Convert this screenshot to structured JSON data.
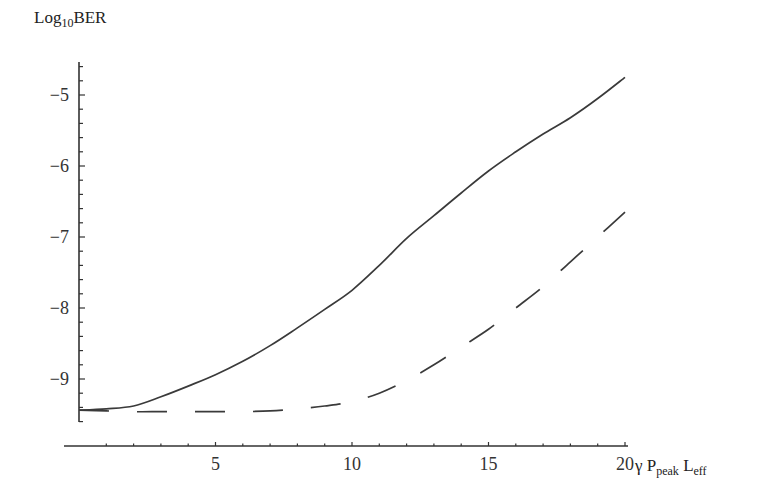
{
  "chart_data": {
    "type": "line",
    "title": "",
    "xlabel": "γ P_peak L_eff",
    "ylabel": "Log10BER",
    "xlim": [
      0,
      20
    ],
    "ylim": [
      -9.6,
      -4.5
    ],
    "x_ticks": [
      5,
      10,
      15,
      20
    ],
    "y_ticks": [
      -5,
      -6,
      -7,
      -8,
      -9
    ],
    "grid": false,
    "legend": null,
    "series": [
      {
        "name": "solid",
        "style": "solid",
        "x": [
          0,
          1,
          2,
          3,
          4,
          5,
          6,
          7,
          8,
          9,
          10,
          11,
          12,
          13,
          14,
          15,
          16,
          17,
          18,
          19,
          20
        ],
        "values": [
          -9.44,
          -9.42,
          -9.38,
          -9.25,
          -9.1,
          -8.94,
          -8.75,
          -8.53,
          -8.28,
          -8.02,
          -7.75,
          -7.4,
          -7.02,
          -6.7,
          -6.38,
          -6.07,
          -5.8,
          -5.55,
          -5.32,
          -5.05,
          -4.75
        ]
      },
      {
        "name": "dashed",
        "style": "dashed",
        "x": [
          0,
          1,
          2,
          3,
          4,
          5,
          6,
          7,
          8,
          9,
          10,
          11,
          12,
          13,
          14,
          15,
          16,
          17,
          18,
          19,
          20
        ],
        "values": [
          -9.44,
          -9.45,
          -9.46,
          -9.46,
          -9.46,
          -9.46,
          -9.46,
          -9.45,
          -9.42,
          -9.38,
          -9.32,
          -9.2,
          -9.02,
          -8.8,
          -8.55,
          -8.3,
          -8.0,
          -7.7,
          -7.35,
          -7.0,
          -6.65
        ]
      }
    ]
  },
  "labels": {
    "y_axis_main": "Log",
    "y_axis_sub": "10",
    "y_axis_tail": "BER",
    "x_axis_gamma": "γ P",
    "x_axis_sub1": "peak",
    "x_axis_mid": " L",
    "x_axis_sub2": "eff"
  }
}
